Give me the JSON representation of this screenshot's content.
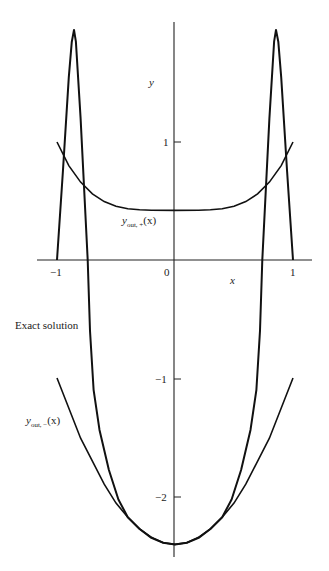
{
  "chart_data": {
    "type": "line",
    "title": "",
    "xlabel": "x",
    "ylabel": "y",
    "xlim": [
      -1.15,
      1.17
    ],
    "ylim": [
      -2.5,
      2.0
    ],
    "grid": false,
    "x_ticks": [
      {
        "value": -1,
        "label": "−1"
      },
      {
        "value": 0,
        "label": "0"
      },
      {
        "value": 1,
        "label": "1"
      }
    ],
    "y_ticks": [
      {
        "value": 1,
        "label": "1"
      },
      {
        "value": -1,
        "label": "−1"
      },
      {
        "value": -2,
        "label": "−2"
      }
    ],
    "series": [
      {
        "name": "Exact solution",
        "points": [
          [
            -1.0,
            0.0
          ],
          [
            -0.95,
            0.75
          ],
          [
            -0.9,
            1.55
          ],
          [
            -0.875,
            1.85
          ],
          [
            -0.856,
            1.95
          ],
          [
            -0.84,
            1.85
          ],
          [
            -0.8,
            1.2
          ],
          [
            -0.74,
            0.0
          ],
          [
            -0.72,
            -0.6
          ],
          [
            -0.69,
            -1.1
          ],
          [
            -0.64,
            -1.44
          ],
          [
            -0.56,
            -1.78
          ],
          [
            -0.48,
            -2.03
          ],
          [
            -0.4,
            -2.18
          ],
          [
            -0.3,
            -2.28
          ],
          [
            -0.2,
            -2.355
          ],
          [
            -0.1,
            -2.396
          ],
          [
            0.0,
            -2.41
          ],
          [
            0.1,
            -2.396
          ],
          [
            0.2,
            -2.355
          ],
          [
            0.3,
            -2.28
          ],
          [
            0.4,
            -2.18
          ],
          [
            0.48,
            -2.03
          ],
          [
            0.56,
            -1.78
          ],
          [
            0.64,
            -1.44
          ],
          [
            0.69,
            -1.1
          ],
          [
            0.72,
            -0.6
          ],
          [
            0.74,
            0.0
          ],
          [
            0.8,
            1.2
          ],
          [
            0.84,
            1.85
          ],
          [
            0.856,
            1.95
          ],
          [
            0.875,
            1.85
          ],
          [
            0.9,
            1.55
          ],
          [
            0.95,
            0.75
          ],
          [
            1.0,
            0.0
          ]
        ]
      },
      {
        "name": "y_out,+(x)",
        "points": [
          [
            -1.0,
            1.0
          ],
          [
            -0.9,
            0.8
          ],
          [
            -0.8,
            0.66
          ],
          [
            -0.7,
            0.56
          ],
          [
            -0.6,
            0.495
          ],
          [
            -0.5,
            0.456
          ],
          [
            -0.4,
            0.435
          ],
          [
            -0.3,
            0.425
          ],
          [
            -0.2,
            0.421
          ],
          [
            0.0,
            0.42
          ],
          [
            0.2,
            0.421
          ],
          [
            0.3,
            0.425
          ],
          [
            0.4,
            0.435
          ],
          [
            0.5,
            0.456
          ],
          [
            0.6,
            0.495
          ],
          [
            0.7,
            0.56
          ],
          [
            0.8,
            0.66
          ],
          [
            0.9,
            0.8
          ],
          [
            1.0,
            1.0
          ]
        ]
      },
      {
        "name": "y_out,−(x)",
        "points": [
          [
            -1.0,
            -1.0
          ],
          [
            -0.8,
            -1.51
          ],
          [
            -0.6,
            -1.9
          ],
          [
            -0.5,
            -2.06
          ],
          [
            -0.4,
            -2.18
          ],
          [
            -0.3,
            -2.28
          ],
          [
            -0.2,
            -2.35
          ],
          [
            -0.1,
            -2.396
          ],
          [
            0.0,
            -2.41
          ],
          [
            0.1,
            -2.396
          ],
          [
            0.2,
            -2.35
          ],
          [
            0.3,
            -2.28
          ],
          [
            0.4,
            -2.18
          ],
          [
            0.5,
            -2.06
          ],
          [
            0.6,
            -1.9
          ],
          [
            0.8,
            -1.51
          ],
          [
            1.0,
            -1.0
          ]
        ]
      }
    ],
    "annotations": [
      {
        "text": "Exact solution",
        "x": -1.35,
        "y": -0.55
      },
      {
        "text": "y_out,+(x)",
        "x": -0.45,
        "y": 0.3
      },
      {
        "text": "y_out,−(x)",
        "x": -1.25,
        "y": -1.4
      }
    ]
  },
  "labels": {
    "axis_x": "x",
    "axis_y": "y",
    "tick_x_neg1": "−1",
    "tick_x_0": "0",
    "tick_x_1": "1",
    "tick_y_1": "1",
    "tick_y_neg1": "−1",
    "tick_y_neg2": "−2",
    "exact_solution": "Exact solution",
    "y_out_main": "y",
    "y_out_plus_sub": "out, +",
    "y_out_minus_sub": "out, −",
    "arg": "(x)",
    "page_fragment": "27"
  }
}
